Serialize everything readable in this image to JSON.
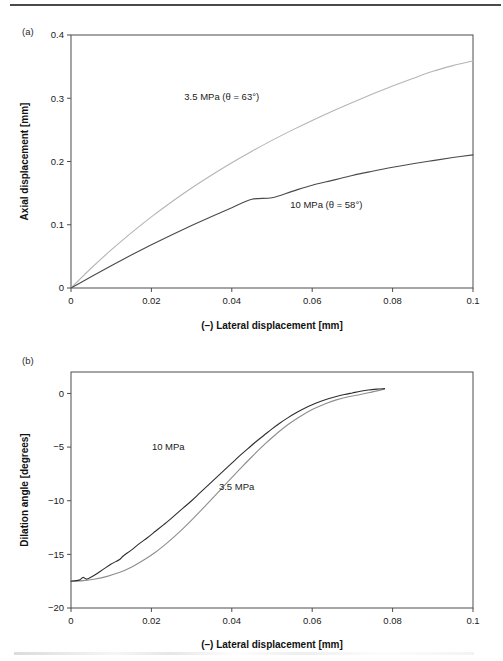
{
  "figure": {
    "panel_a_tag": "(a)",
    "panel_b_tag": "(b)",
    "shared_xlabel": "(–) Lateral displacement [mm]"
  },
  "chart_data": [
    {
      "id": "panel-a",
      "type": "line",
      "panel": "(a)",
      "title": "",
      "xlabel": "(–) Lateral displacement [mm]",
      "ylabel": "Axial displacement [mm]",
      "xlim": [
        0,
        0.1
      ],
      "ylim": [
        0,
        0.4
      ],
      "xticks": [
        0,
        0.02,
        0.04,
        0.06,
        0.08,
        0.1
      ],
      "xtick_labels": [
        "0",
        "0.02",
        "0.04",
        "0.06",
        "0.08",
        "0.1"
      ],
      "yticks": [
        0,
        0.1,
        0.2,
        0.3,
        0.4
      ],
      "ytick_labels": [
        "0",
        "0.1",
        "0.2",
        "0.3",
        "0.4"
      ],
      "grid": false,
      "legend_position": "inline-annotation",
      "series": [
        {
          "name": "3.5 MPa",
          "annotation": "3.5 MPa (θ = 63°)",
          "annotation_x": 0.0375,
          "annotation_y": 0.298,
          "color": "#b5b5b5",
          "width": 1.1,
          "x": [
            0,
            0.005,
            0.01,
            0.015,
            0.02,
            0.025,
            0.03,
            0.035,
            0.04,
            0.045,
            0.05,
            0.055,
            0.06,
            0.065,
            0.07,
            0.075,
            0.08,
            0.085,
            0.09,
            0.095,
            0.1
          ],
          "y": [
            0,
            0.0312,
            0.0602,
            0.0872,
            0.1124,
            0.136,
            0.158,
            0.1786,
            0.198,
            0.2162,
            0.2334,
            0.2496,
            0.265,
            0.2796,
            0.2934,
            0.3066,
            0.3192,
            0.3312,
            0.3426,
            0.3516,
            0.359
          ]
        },
        {
          "name": "10 MPa",
          "annotation": "10 MPa (θ = 58°)",
          "annotation_x": 0.0635,
          "annotation_y": 0.126,
          "color": "#4a4a4a",
          "width": 1.1,
          "x": [
            0,
            0.005,
            0.01,
            0.015,
            0.02,
            0.025,
            0.03,
            0.035,
            0.04,
            0.045,
            0.05,
            0.055,
            0.06,
            0.065,
            0.07,
            0.075,
            0.08,
            0.085,
            0.09,
            0.095,
            0.1
          ],
          "y": [
            0,
            0.0178,
            0.0352,
            0.052,
            0.0682,
            0.0838,
            0.0988,
            0.1132,
            0.127,
            0.1402,
            0.1428,
            0.1528,
            0.1626,
            0.1702,
            0.178,
            0.1846,
            0.1908,
            0.1964,
            0.2014,
            0.2062,
            0.2104
          ]
        }
      ]
    },
    {
      "id": "panel-b",
      "type": "line",
      "panel": "(b)",
      "title": "",
      "xlabel": "(–) Lateral displacement [mm]",
      "ylabel": "Dilation angle [degrees]",
      "xlim": [
        0,
        0.1
      ],
      "ylim": [
        -20,
        2
      ],
      "axis_inverted_y": true,
      "xticks": [
        0,
        0.02,
        0.04,
        0.06,
        0.08,
        0.1
      ],
      "xtick_labels": [
        "0",
        "0.02",
        "0.04",
        "0.06",
        "0.08",
        "0.1"
      ],
      "yticks": [
        -20,
        -15,
        -10,
        -5,
        0
      ],
      "ytick_labels": [
        "−20",
        "−15",
        "−10",
        "−5",
        "0"
      ],
      "grid": false,
      "legend_position": "inline-annotation",
      "series": [
        {
          "name": "3.5 MPa",
          "annotation": "3.5 MPa",
          "annotation_x": 0.0412,
          "annotation_y": -9.0,
          "color": "#8e8e8e",
          "width": 1.1,
          "x": [
            0,
            0.003,
            0.006,
            0.009,
            0.012,
            0.015,
            0.018,
            0.021,
            0.024,
            0.027,
            0.03,
            0.033,
            0.036,
            0.039,
            0.042,
            0.045,
            0.048,
            0.051,
            0.054,
            0.057,
            0.06,
            0.063,
            0.066,
            0.069,
            0.072,
            0.075,
            0.078
          ],
          "y": [
            -17.5,
            -17.45,
            -17.3,
            -17.05,
            -16.7,
            -16.2,
            -15.55,
            -14.8,
            -13.9,
            -12.9,
            -11.8,
            -10.65,
            -9.45,
            -8.25,
            -7.05,
            -5.9,
            -4.8,
            -3.8,
            -2.9,
            -2.15,
            -1.5,
            -1.0,
            -0.6,
            -0.3,
            -0.1,
            0.15,
            0.4
          ]
        },
        {
          "name": "10 MPa",
          "annotation": "10 MPa",
          "annotation_x": 0.0242,
          "annotation_y": -5.3,
          "color": "#2e2e2e",
          "width": 1.1,
          "x": [
            0,
            0.002,
            0.003,
            0.004,
            0.006,
            0.008,
            0.01,
            0.012,
            0.013,
            0.015,
            0.017,
            0.019,
            0.021,
            0.023,
            0.024,
            0.026,
            0.028,
            0.03,
            0.032,
            0.034,
            0.036,
            0.038,
            0.04,
            0.042,
            0.044,
            0.046,
            0.048,
            0.05,
            0.052,
            0.054,
            0.056,
            0.058,
            0.06,
            0.062,
            0.064,
            0.066,
            0.068,
            0.07,
            0.072,
            0.074,
            0.076,
            0.078
          ],
          "y": [
            -17.5,
            -17.4,
            -17.15,
            -17.3,
            -16.9,
            -16.4,
            -15.9,
            -15.5,
            -15.15,
            -14.6,
            -14.0,
            -13.45,
            -12.85,
            -12.25,
            -11.95,
            -11.3,
            -10.65,
            -10.0,
            -9.3,
            -8.6,
            -7.9,
            -7.2,
            -6.5,
            -5.8,
            -5.15,
            -4.5,
            -3.9,
            -3.3,
            -2.75,
            -2.25,
            -1.8,
            -1.4,
            -1.05,
            -0.75,
            -0.5,
            -0.28,
            -0.1,
            0.05,
            0.2,
            0.32,
            0.4,
            0.45
          ]
        }
      ]
    }
  ]
}
